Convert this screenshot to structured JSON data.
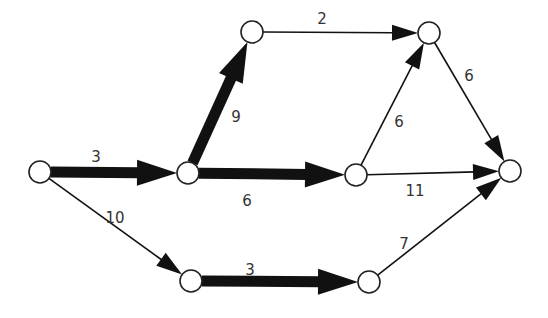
{
  "diagram": {
    "type": "network-critical-path",
    "nodes": [
      {
        "id": "n1",
        "x": 40,
        "y": 172
      },
      {
        "id": "n2",
        "x": 188,
        "y": 173
      },
      {
        "id": "n3",
        "x": 252,
        "y": 32
      },
      {
        "id": "n4",
        "x": 429,
        "y": 33
      },
      {
        "id": "n5",
        "x": 356,
        "y": 175
      },
      {
        "id": "n6",
        "x": 510,
        "y": 171
      },
      {
        "id": "n7",
        "x": 191,
        "y": 281
      },
      {
        "id": "n8",
        "x": 369,
        "y": 282
      }
    ],
    "edges": [
      {
        "from": "n1",
        "to": "n2",
        "weight": "3",
        "critical": true,
        "label_x": 96,
        "label_y": 162
      },
      {
        "from": "n2",
        "to": "n3",
        "weight": "9",
        "critical": true,
        "label_x": 236,
        "label_y": 122
      },
      {
        "from": "n2",
        "to": "n5",
        "weight": "6",
        "critical": true,
        "label_x": 247,
        "label_y": 206
      },
      {
        "from": "n3",
        "to": "n4",
        "weight": "2",
        "critical": false,
        "label_x": 322,
        "label_y": 24
      },
      {
        "from": "n5",
        "to": "n4",
        "weight": "6",
        "critical": false,
        "label_x": 399,
        "label_y": 127
      },
      {
        "from": "n4",
        "to": "n6",
        "weight": "6",
        "critical": false,
        "label_x": 469,
        "label_y": 81
      },
      {
        "from": "n5",
        "to": "n6",
        "weight": "11",
        "critical": false,
        "label_x": 415,
        "label_y": 196
      },
      {
        "from": "n1",
        "to": "n7",
        "weight": "10",
        "critical": false,
        "label_x": 115,
        "label_y": 223
      },
      {
        "from": "n7",
        "to": "n8",
        "weight": "3",
        "critical": true,
        "label_x": 250,
        "label_y": 275
      },
      {
        "from": "n8",
        "to": "n6",
        "weight": "7",
        "critical": false,
        "label_x": 404,
        "label_y": 249
      }
    ],
    "colors": {
      "line": "#111111",
      "node_fill": "#ffffff",
      "node_stroke": "#222222",
      "label": "#333333"
    }
  }
}
